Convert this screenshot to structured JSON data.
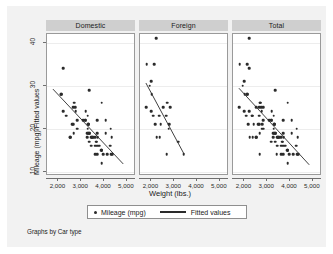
{
  "figure": {
    "background_color": "#f2f2f2",
    "panel_background_color": "#ffffff",
    "panel_header_color": "#cfcfcf",
    "marker_color": "#2b2b2b",
    "line_color": "#2b2b2b",
    "footer_note": "Graphs by Car type"
  },
  "axes": {
    "y_title": "Mileage (mpg)/Fitted values",
    "x_title": "Weight (lbs.)",
    "y_ticks": [
      "40",
      "30",
      "20",
      "10"
    ],
    "x_ticks": [
      "2,000",
      "3,000",
      "4,000",
      "5,000"
    ]
  },
  "legend": {
    "marker_label": "Mileage (mpg)",
    "line_label": "Fitted values"
  },
  "panels": [
    {
      "title": "Domestic"
    },
    {
      "title": "Foreign"
    },
    {
      "title": "Total"
    }
  ],
  "chart_data": {
    "type": "scatter",
    "title": "",
    "subtitle": "",
    "xlabel": "Weight (lbs.)",
    "ylabel": "Mileage (mpg)/Fitted values",
    "xlim": [
      1500,
      5400
    ],
    "ylim": [
      9,
      42
    ],
    "xticks": [
      2000,
      3000,
      4000,
      5000
    ],
    "xticklabels": [
      "2,000",
      "3,000",
      "4,000",
      "5,000"
    ],
    "yticks": [
      10,
      20,
      30,
      40
    ],
    "yticklabels": [
      "10",
      "20",
      "30",
      "40"
    ],
    "grid": true,
    "grid_axis": "y",
    "legend_position": "below",
    "legend_entries": [
      "Mileage (mpg)",
      "Fitted values"
    ],
    "facet_by": "Car type",
    "facet_note": "Graphs by Car type",
    "panels": [
      {
        "name": "Domestic",
        "series": [
          {
            "name": "Mileage (mpg)",
            "type": "scatter",
            "x": [
              4080,
              3670,
              3690,
              3280,
              3880,
              4330,
              3900,
              4290,
              4260,
              3690,
              4325,
              3950,
              3310,
              3360,
              2330,
              2200,
              2520,
              2130,
              4370,
              2650,
              3250,
              4080,
              3720,
              3370,
              4130,
              3600,
              3330,
              3600,
              3080,
              2750,
              3430,
              3350,
              3380,
              3900,
              3200,
              3470,
              3640,
              3670,
              3550,
              3330,
              3700,
              3490,
              2200,
              2520,
              2830,
              2130,
              2670,
              2595,
              3310,
              3600,
              2640,
              2830,
              3170,
              3260,
              3200,
              3440,
              2690,
              3800,
              3900,
              3890,
              2730,
              3280,
              3300,
              3690
            ],
            "y": [
              22,
              17,
              22,
              20,
              15,
              18,
              26,
              20,
              16,
              19,
              14,
              14,
              21,
              29,
              23,
              24,
              18,
              28,
              14,
              21,
              19,
              19,
              18,
              19,
              14,
              14,
              21,
              16,
              22,
              24,
              18,
              17,
              19,
              15,
              22,
              18,
              17,
              17,
              18,
              19,
              16,
              18,
              34,
              18,
              20,
              28,
              19,
              21,
              21,
              18,
              25,
              22,
              22,
              18,
              24,
              16,
              26,
              16,
              15,
              12,
              25,
              23,
              19,
              14
            ]
          },
          {
            "name": "Fitted values",
            "type": "line",
            "x": [
              1760,
              4840
            ],
            "y": [
              29.2,
              11.8
            ]
          }
        ]
      },
      {
        "name": "Foreign",
        "series": [
          {
            "name": "Mileage (mpg)",
            "type": "scatter",
            "x": [
              2640,
              2830,
              2070,
              2130,
              1760,
              2020,
              1930,
              1990,
              2160,
              2670,
              2370,
              2200,
              2520,
              2780,
              1800,
              1990,
              3170,
              2690,
              2750,
              2240,
              2410,
              2330,
              3420
            ],
            "y": [
              23,
              25,
              23,
              35,
              25,
              28,
              30,
              24,
              21,
              14,
              18,
              41,
              25,
              21,
              35,
              31,
              17,
              26,
              20,
              18,
              21,
              23,
              14
            ]
          },
          {
            "name": "Fitted values",
            "type": "line",
            "x": [
              1760,
              3420
            ],
            "y": [
              30.6,
              14.2
            ]
          }
        ]
      },
      {
        "name": "Total",
        "series": [
          {
            "name": "Mileage (mpg)",
            "type": "scatter",
            "x": [
              4080,
              3670,
              3690,
              3280,
              3880,
              4330,
              3900,
              4290,
              4260,
              3690,
              4325,
              3950,
              3310,
              3360,
              2330,
              2200,
              2520,
              2130,
              4370,
              2650,
              3250,
              4080,
              3720,
              3370,
              4130,
              3600,
              3330,
              3600,
              3080,
              2750,
              3430,
              3350,
              3380,
              3900,
              3200,
              3470,
              3640,
              3670,
              3550,
              3330,
              3700,
              3490,
              2200,
              2520,
              2830,
              2130,
              2670,
              2595,
              3310,
              3600,
              2640,
              2830,
              3170,
              3260,
              3200,
              3440,
              2690,
              3800,
              3900,
              3890,
              2730,
              3280,
              3300,
              3690,
              2640,
              2830,
              2070,
              2130,
              1760,
              2020,
              1930,
              1990,
              2160,
              2670,
              2370,
              2200,
              2520,
              2780,
              1800,
              1990,
              3170,
              2690,
              2750,
              2240,
              2410,
              2330,
              3420
            ],
            "y": [
              22,
              17,
              22,
              20,
              15,
              18,
              26,
              20,
              16,
              19,
              14,
              14,
              21,
              29,
              23,
              24,
              18,
              28,
              14,
              21,
              19,
              19,
              18,
              19,
              14,
              14,
              21,
              16,
              22,
              24,
              18,
              17,
              19,
              15,
              22,
              18,
              17,
              17,
              18,
              19,
              16,
              18,
              34,
              18,
              20,
              28,
              19,
              21,
              21,
              18,
              25,
              22,
              22,
              18,
              24,
              16,
              26,
              16,
              15,
              12,
              25,
              23,
              19,
              14,
              23,
              25,
              23,
              35,
              25,
              28,
              30,
              24,
              21,
              14,
              18,
              41,
              25,
              21,
              35,
              31,
              17,
              26,
              20,
              18,
              21,
              23,
              14
            ]
          },
          {
            "name": "Fitted values",
            "type": "line",
            "x": [
              1760,
              4840
            ],
            "y": [
              29.4,
              11.6
            ]
          }
        ]
      }
    ]
  }
}
